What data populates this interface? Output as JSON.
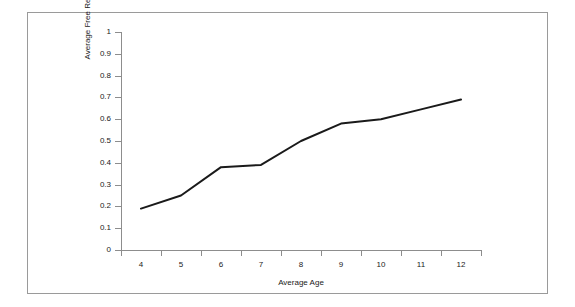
{
  "chart_data": {
    "type": "line",
    "title": "",
    "subtitle": "",
    "xlabel": "Average Age",
    "ylabel": "Average Free Recall",
    "categories": [
      "4",
      "5",
      "6",
      "7",
      "8",
      "9",
      "10",
      "11",
      "12"
    ],
    "x": [
      4,
      5,
      6,
      7,
      8,
      9,
      10,
      11,
      12
    ],
    "series": [
      {
        "name": "Average Free Recall",
        "values": [
          0.19,
          0.25,
          0.38,
          0.39,
          0.5,
          0.58,
          0.6,
          0.645,
          0.69
        ],
        "color": "#1a1a1a",
        "line_width": 2,
        "markers": false
      }
    ],
    "ylim": [
      0,
      1
    ],
    "ytick_labels": [
      "0",
      "0.1",
      "0.2",
      "0.3",
      "0.4",
      "0.5",
      "0.6",
      "0.7",
      "0.8",
      "0.9",
      "1"
    ],
    "ytick_values": [
      0,
      0.1,
      0.2,
      0.3,
      0.4,
      0.5,
      0.6,
      0.7,
      0.8,
      0.9,
      1
    ],
    "grid": false,
    "legend": false,
    "legend_position": "none",
    "axis_color": "#8d8d8d",
    "frame_color": "#9a9a9a",
    "background": "#ffffff"
  }
}
